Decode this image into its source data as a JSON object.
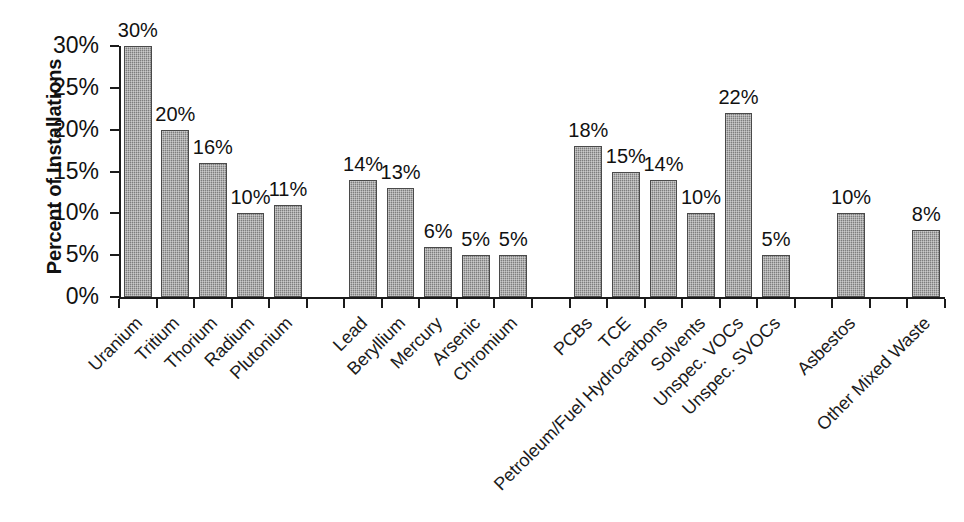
{
  "chart_data": {
    "type": "bar",
    "title": "",
    "xlabel": "",
    "ylabel": "Percent of Installations",
    "ylim": [
      0,
      30
    ],
    "grid": false,
    "legend": "none",
    "ytick_labels": [
      "0%",
      "5%",
      "10%",
      "15%",
      "20%",
      "25%",
      "30%"
    ],
    "ytick_values": [
      0,
      5,
      10,
      15,
      20,
      25,
      30
    ],
    "value_label_suffix": "%",
    "categories": [
      "Uranium",
      "Tritium",
      "Thorium",
      "Radium",
      "Plutonium",
      "",
      "Lead",
      "Beryllium",
      "Mercury",
      "Arsenic",
      "Chromium",
      "",
      "PCBs",
      "TCE",
      "Petroleum/Fuel Hydrocarbons",
      "Solvents",
      "Unspec. VOCs",
      "Unspec. SVOCs",
      "",
      "Asbestos",
      "",
      "Other Mixed Waste"
    ],
    "values": [
      30,
      20,
      16,
      10,
      11,
      null,
      14,
      13,
      6,
      5,
      5,
      null,
      18,
      15,
      14,
      10,
      22,
      5,
      null,
      10,
      null,
      8
    ],
    "value_labels": [
      "30%",
      "20%",
      "16%",
      "10%",
      "11%",
      "",
      "14%",
      "13%",
      "6%",
      "5%",
      "5%",
      "",
      "18%",
      "15%",
      "14%",
      "10%",
      "22%",
      "5%",
      "",
      "10%",
      "",
      "8%"
    ],
    "bar_color": "#8c8c8c",
    "bar_edge_color": "#4a4a4a",
    "axis_color": "#1b1b1b"
  },
  "bars": [
    {
      "label": "Uranium",
      "value": 30,
      "value_label": "30%",
      "slot": 0
    },
    {
      "label": "Tritium",
      "value": 20,
      "value_label": "20%",
      "slot": 1
    },
    {
      "label": "Thorium",
      "value": 16,
      "value_label": "16%",
      "slot": 2
    },
    {
      "label": "Radium",
      "value": 10,
      "value_label": "10%",
      "slot": 3
    },
    {
      "label": "Plutonium",
      "value": 11,
      "value_label": "11%",
      "slot": 4
    },
    {
      "label": "Lead",
      "value": 14,
      "value_label": "14%",
      "slot": 6
    },
    {
      "label": "Beryllium",
      "value": 13,
      "value_label": "13%",
      "slot": 7
    },
    {
      "label": "Mercury",
      "value": 6,
      "value_label": "6%",
      "slot": 8
    },
    {
      "label": "Arsenic",
      "value": 5,
      "value_label": "5%",
      "slot": 9
    },
    {
      "label": "Chromium",
      "value": 5,
      "value_label": "5%",
      "slot": 10
    },
    {
      "label": "PCBs",
      "value": 18,
      "value_label": "18%",
      "slot": 12
    },
    {
      "label": "TCE",
      "value": 15,
      "value_label": "15%",
      "slot": 13
    },
    {
      "label": "Petroleum/Fuel Hydrocarbons",
      "value": 14,
      "value_label": "14%",
      "slot": 14
    },
    {
      "label": "Solvents",
      "value": 10,
      "value_label": "10%",
      "slot": 15
    },
    {
      "label": "Unspec. VOCs",
      "value": 22,
      "value_label": "22%",
      "slot": 16
    },
    {
      "label": "Unspec. SVOCs",
      "value": 5,
      "value_label": "5%",
      "slot": 17
    },
    {
      "label": "Asbestos",
      "value": 10,
      "value_label": "10%",
      "slot": 19
    },
    {
      "label": "Other Mixed Waste",
      "value": 8,
      "value_label": "8%",
      "slot": 21
    }
  ]
}
